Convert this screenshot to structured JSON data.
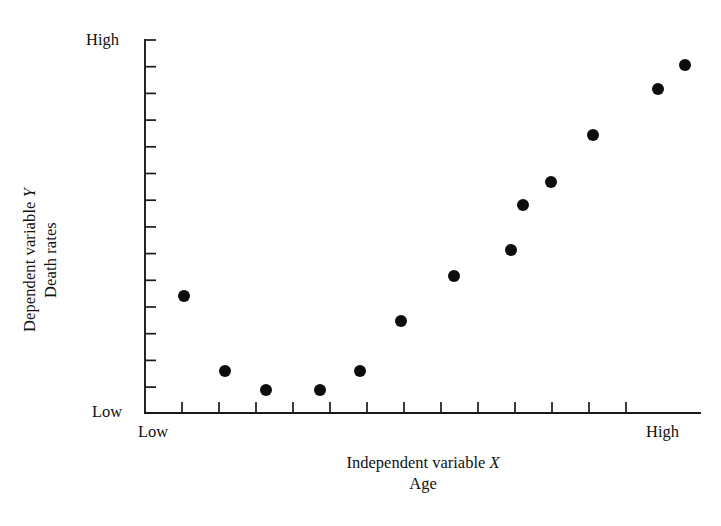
{
  "figure": {
    "kind": "scatter-plot",
    "background_color": "#ffffff",
    "ink_color": "#111111"
  },
  "axes": {
    "y": {
      "label_line1_prefix": "Dependent variable ",
      "label_line1_var": "Y",
      "label_line2": "Death rates",
      "high_label": "High",
      "low_label": "Low",
      "tick_count": 14
    },
    "x": {
      "label_line1_prefix": "Independent variable ",
      "label_line1_var": "X",
      "label_line2": "Age",
      "low_label": "Low",
      "high_label": "High",
      "tick_count": 13
    }
  },
  "chart_data": {
    "type": "scatter",
    "title": "",
    "xlabel": "Independent variable X / Age",
    "ylabel": "Dependent variable Y / Death rates",
    "xlim": [
      0,
      14
    ],
    "ylim": [
      0,
      14
    ],
    "xtick_labels": [
      "Low",
      "",
      "",
      "",
      "",
      "",
      "",
      "",
      "",
      "",
      "",
      "",
      "High"
    ],
    "ytick_labels": [
      "Low",
      "",
      "",
      "",
      "",
      "",
      "",
      "",
      "",
      "",
      "",
      "",
      "",
      "High"
    ],
    "grid": false,
    "legend": null,
    "marker": "filled-circle",
    "marker_color": "#0d0d0d",
    "marker_radius_px": 6,
    "annotation": "J-shaped (U-shaped) relationship: death rates are elevated at the youngest ages, fall to a minimum in early adulthood, then rise steeply with increasing age.",
    "points": [
      {
        "x": 1,
        "y": 4.4,
        "px": 184,
        "py": 296
      },
      {
        "x": 2,
        "y": 1.6,
        "px": 225,
        "py": 371
      },
      {
        "x": 3,
        "y": 0.9,
        "px": 266,
        "py": 390
      },
      {
        "x": 4,
        "y": 0.9,
        "px": 320,
        "py": 390
      },
      {
        "x": 5,
        "y": 1.6,
        "px": 360,
        "py": 371
      },
      {
        "x": 6,
        "y": 3.5,
        "px": 401,
        "py": 321
      },
      {
        "x": 7,
        "y": 5.2,
        "px": 454,
        "py": 276
      },
      {
        "x": 8,
        "y": 6.1,
        "px": 511,
        "py": 250
      },
      {
        "x": 9,
        "y": 7.8,
        "px": 523,
        "py": 205
      },
      {
        "x": 10,
        "y": 8.7,
        "px": 551,
        "py": 182
      },
      {
        "x": 11,
        "y": 10.5,
        "px": 593,
        "py": 135
      },
      {
        "x": 12,
        "y": 12.2,
        "px": 658,
        "py": 89
      },
      {
        "x": 13,
        "y": 13.1,
        "px": 685,
        "py": 65
      }
    ]
  },
  "geometry": {
    "origin_x": 145,
    "origin_y": 413,
    "axis_top_y": 40,
    "axis_right_x": 700,
    "y_tick_start_y": 40,
    "y_tick_step": 26.7,
    "y_tick_len": 11,
    "x_tick_start_x": 182,
    "x_tick_step": 37,
    "x_tick_len": 11
  }
}
